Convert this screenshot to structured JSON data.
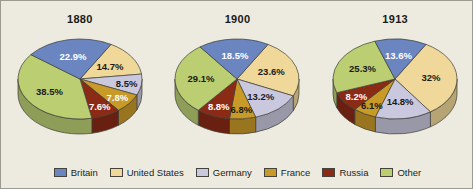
{
  "figure": {
    "background_color": "#edebdf",
    "border_color": "#9b9a90"
  },
  "legend": {
    "position": "bottom-center",
    "items": [
      {
        "label": "Britain",
        "color": "#6b85c0"
      },
      {
        "label": "United States",
        "color": "#efd89a"
      },
      {
        "label": "Germany",
        "color": "#c9c8de"
      },
      {
        "label": "France",
        "color": "#c89a28"
      },
      {
        "label": "Russia",
        "color": "#8b2a15"
      },
      {
        "label": "Other",
        "color": "#bbce72"
      }
    ]
  },
  "chart_data": [
    {
      "type": "pie",
      "title": "1880",
      "xlabel": "",
      "ylabel": "",
      "start_angle_deg": -60,
      "direction": "clockwise",
      "categories": [
        "United States",
        "Germany",
        "France",
        "Russia",
        "Other",
        "Britain"
      ],
      "values": [
        14.7,
        8.5,
        7.8,
        7.6,
        38.5,
        22.9
      ],
      "labels": [
        "14.7%",
        "8.5%",
        "7.8%",
        "7.6%",
        "38.5%",
        "22.9%"
      ],
      "label_colors": [
        "#1a1a18",
        "#1a1a18",
        "#ffffff",
        "#ffffff",
        "#1a1a18",
        "#ffffff"
      ],
      "colors": [
        "#efd89a",
        "#c9c8de",
        "#c89a28",
        "#8b2a15",
        "#bbce72",
        "#6b85c0"
      ]
    },
    {
      "type": "pie",
      "title": "1900",
      "xlabel": "",
      "ylabel": "",
      "start_angle_deg": -60,
      "direction": "clockwise",
      "categories": [
        "United States",
        "Germany",
        "France",
        "Russia",
        "Other",
        "Britain"
      ],
      "values": [
        23.6,
        13.2,
        6.8,
        8.8,
        29.1,
        18.5
      ],
      "labels": [
        "23.6%",
        "13.2%",
        "6.8%",
        "8.8%",
        "29.1%",
        "18.5%"
      ],
      "label_colors": [
        "#1a1a18",
        "#1a1a18",
        "#1a1a18",
        "#ffffff",
        "#1a1a18",
        "#ffffff"
      ],
      "colors": [
        "#efd89a",
        "#c9c8de",
        "#c89a28",
        "#8b2a15",
        "#bbce72",
        "#6b85c0"
      ]
    },
    {
      "type": "pie",
      "title": "1913",
      "xlabel": "",
      "ylabel": "",
      "start_angle_deg": -60,
      "direction": "clockwise",
      "categories": [
        "United States",
        "Germany",
        "France",
        "Russia",
        "Other",
        "Britain"
      ],
      "values": [
        32,
        14.8,
        6.1,
        8.2,
        25.3,
        13.6
      ],
      "labels": [
        "32%",
        "14.8%",
        "6.1%",
        "8.2%",
        "25.3%",
        "13.6%"
      ],
      "label_colors": [
        "#1a1a18",
        "#1a1a18",
        "#1a1a18",
        "#ffffff",
        "#1a1a18",
        "#ffffff"
      ],
      "colors": [
        "#efd89a",
        "#c9c8de",
        "#c89a28",
        "#8b2a15",
        "#bbce72",
        "#6b85c0"
      ]
    }
  ]
}
